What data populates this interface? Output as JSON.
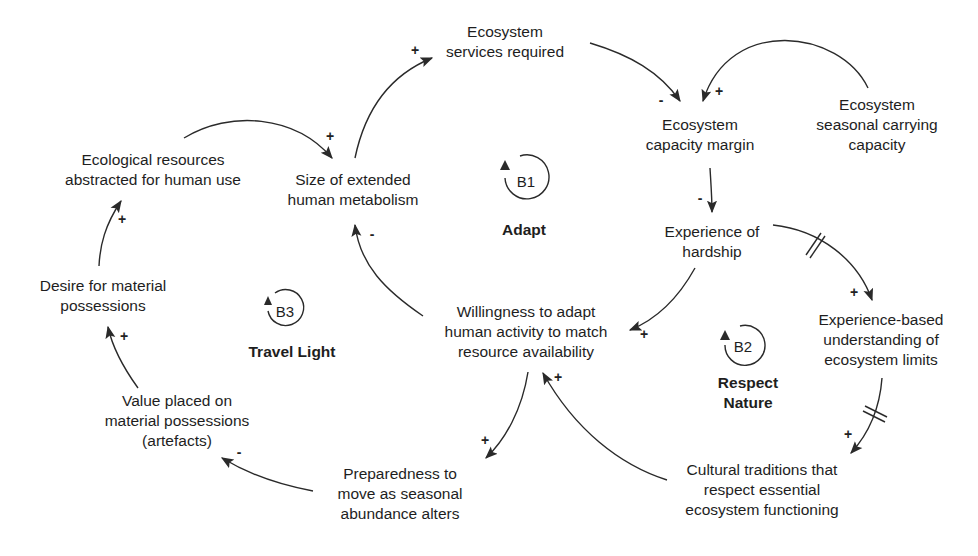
{
  "diagram": {
    "type": "causal-loop-diagram",
    "nodes": {
      "ecosystem_services": "Ecosystem\nservices required",
      "capacity_margin": "Ecosystem\ncapacity margin",
      "carrying_capacity": "Ecosystem\nseasonal carrying\ncapacity",
      "ecological_resources": "Ecological resources\nabstracted for human use",
      "extended_metabolism": "Size of extended\nhuman metabolism",
      "hardship": "Experience of\nhardship",
      "desire_possessions": "Desire for material\npossessions",
      "willingness_adapt": "Willingness to adapt\nhuman activity to match\nresource availability",
      "experience_understanding": "Experience-based\nunderstanding of\necosystem limits",
      "value_possessions": "Value placed on\nmaterial possessions\n(artefacts)",
      "preparedness_move": "Preparedness to\nmove as seasonal\nabundance alters",
      "cultural_traditions": "Cultural traditions that\nrespect essential\necosystem functioning"
    },
    "loops": [
      {
        "id": "B1",
        "name": "Adapt"
      },
      {
        "id": "B2",
        "name": "Respect\nNature"
      },
      {
        "id": "B3",
        "name": "Travel Light"
      }
    ],
    "links": [
      {
        "from": "extended_metabolism",
        "to": "ecosystem_services",
        "polarity": "+",
        "delay": false
      },
      {
        "from": "ecosystem_services",
        "to": "capacity_margin",
        "polarity": "-",
        "delay": false
      },
      {
        "from": "carrying_capacity",
        "to": "capacity_margin",
        "polarity": "+",
        "delay": false
      },
      {
        "from": "capacity_margin",
        "to": "hardship",
        "polarity": "-",
        "delay": false
      },
      {
        "from": "hardship",
        "to": "willingness_adapt",
        "polarity": "+",
        "delay": false
      },
      {
        "from": "hardship",
        "to": "experience_understanding",
        "polarity": "+",
        "delay": true
      },
      {
        "from": "experience_understanding",
        "to": "cultural_traditions",
        "polarity": "+",
        "delay": true
      },
      {
        "from": "cultural_traditions",
        "to": "willingness_adapt",
        "polarity": "+",
        "delay": false
      },
      {
        "from": "willingness_adapt",
        "to": "extended_metabolism",
        "polarity": "-",
        "delay": false
      },
      {
        "from": "willingness_adapt",
        "to": "preparedness_move",
        "polarity": "+",
        "delay": false
      },
      {
        "from": "preparedness_move",
        "to": "value_possessions",
        "polarity": "-",
        "delay": false
      },
      {
        "from": "value_possessions",
        "to": "desire_possessions",
        "polarity": "+",
        "delay": false
      },
      {
        "from": "desire_possessions",
        "to": "ecological_resources",
        "polarity": "+",
        "delay": false
      },
      {
        "from": "ecological_resources",
        "to": "extended_metabolism",
        "polarity": "+",
        "delay": false
      }
    ],
    "colors": {
      "line": "#2a2a2a",
      "text": "#1e1e1e",
      "background": "#ffffff"
    }
  }
}
